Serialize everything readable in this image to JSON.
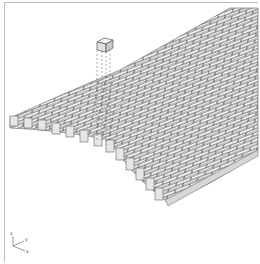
{
  "figure": {
    "colors": {
      "brick_face": "#f2f2f2",
      "brick_side": "#cfcfcf",
      "mortar": "#555555",
      "frame": "#bbbbbb"
    },
    "axes": {
      "z": "z",
      "y": "y",
      "x": "x"
    }
  }
}
